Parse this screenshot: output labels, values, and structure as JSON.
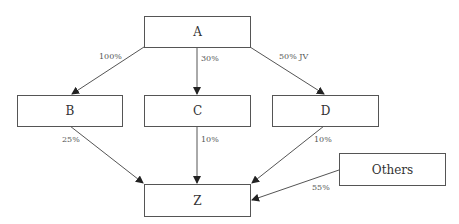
{
  "diagram": {
    "type": "ownership-structure",
    "nodes": [
      {
        "id": "A",
        "label": "A"
      },
      {
        "id": "B",
        "label": "B"
      },
      {
        "id": "C",
        "label": "C"
      },
      {
        "id": "D",
        "label": "D"
      },
      {
        "id": "Z",
        "label": "Z"
      },
      {
        "id": "Others",
        "label": "Others"
      }
    ],
    "edges": [
      {
        "from": "A",
        "to": "B",
        "label": "100%"
      },
      {
        "from": "A",
        "to": "C",
        "label": "30%"
      },
      {
        "from": "A",
        "to": "D",
        "label": "50% JV"
      },
      {
        "from": "B",
        "to": "Z",
        "label": "25%"
      },
      {
        "from": "C",
        "to": "Z",
        "label": "10%"
      },
      {
        "from": "D",
        "to": "Z",
        "label": "10%"
      },
      {
        "from": "Others",
        "to": "Z",
        "label": "55%"
      }
    ]
  },
  "colors": {
    "line": "#555555",
    "text": "#333333"
  }
}
